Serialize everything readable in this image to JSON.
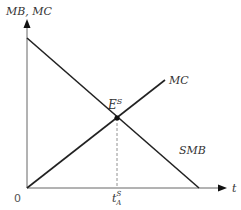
{
  "diagram": {
    "y_axis_label": "MB, MC",
    "x_axis_label": "t",
    "origin_label": "0",
    "curves": [
      {
        "name": "MC",
        "label": "MC",
        "from": [
          27,
          188
        ],
        "to": [
          165,
          80
        ],
        "color": "#222222"
      },
      {
        "name": "SMB",
        "label": "SMB",
        "from": [
          27,
          38
        ],
        "to": [
          199,
          188
        ],
        "color": "#222222"
      }
    ],
    "equilibrium": {
      "label": "E",
      "superscript": "S",
      "point": [
        117,
        118
      ]
    },
    "x_marker": {
      "label": "t",
      "superscript": "S",
      "subscript": "A"
    },
    "colors": {
      "axis": "#666666",
      "curve": "#222222",
      "dashed": "#777777"
    }
  }
}
